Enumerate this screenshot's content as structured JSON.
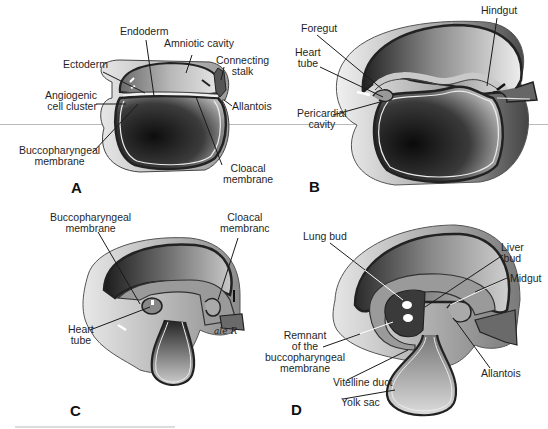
{
  "figure": {
    "panels": [
      {
        "letter": "A",
        "labels": {
          "endoderm": "Endoderm",
          "amniotic_cavity": "Amniotic cavity",
          "ectoderm": "Ectoderm",
          "connecting_stalk_1": "Connecting",
          "connecting_stalk_2": "stalk",
          "angiogenic_1": "Angiogenic",
          "angiogenic_2": "cell cluster",
          "allantois": "Allantois",
          "buccopharyngeal_1": "Buccopharyngeal",
          "buccopharyngeal_2": "membrane",
          "cloacal_1": "Cloacal",
          "cloacal_2": "membrane"
        }
      },
      {
        "letter": "B",
        "labels": {
          "hindgut": "Hindgut",
          "foregut": "Foregut",
          "heart_tube_1": "Heart",
          "heart_tube_2": "tube",
          "pericardial_1": "Pericardial",
          "pericardial_2": "cavity"
        }
      },
      {
        "letter": "C",
        "labels": {
          "buccopharyngeal_1": "Buccopharyngeal",
          "buccopharyngeal_2": "membrane",
          "cloacal_1": "Cloacal",
          "cloacal_2": "membranc",
          "heart_tube_1": "Heart",
          "heart_tube_2": "tube",
          "signature": "ale R"
        }
      },
      {
        "letter": "D",
        "labels": {
          "lung_bud": "Lung bud",
          "liver_bud_1": "Liver",
          "liver_bud_2": "bud",
          "midgut": "Midgut",
          "remnant_1": "Remnant",
          "remnant_2": "of the",
          "remnant_3": "buccopharyngeal",
          "remnant_4": "membrane",
          "allantois": "Allantois",
          "vitelline_duct": "Vitelline duct",
          "yolk_sac": "Yolk sac"
        }
      }
    ],
    "colors": {
      "outline": "#2a2a2a",
      "dark_fill": "#1e1e1e",
      "mid_fill": "#7a7a7a",
      "light_fill": "#d8d8d8",
      "background": "#ffffff",
      "scan_line": "#b9b9b9"
    }
  }
}
